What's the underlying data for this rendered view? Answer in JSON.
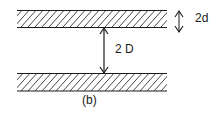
{
  "diagram": {
    "plate_separation_label": "2 D",
    "plate_thickness_label": "2d",
    "caption": "(b)",
    "colors": {
      "ink": "#1a1a1a",
      "background": "#ffffff"
    }
  }
}
